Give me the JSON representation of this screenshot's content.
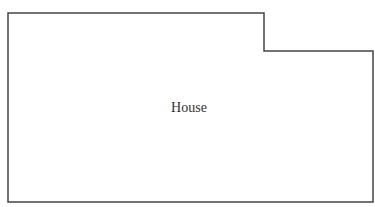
{
  "diagram": {
    "shape": {
      "name": "house-outline",
      "stroke": "#444444",
      "points": "8,13 264,13 264,51 373,51 373,202 8,202"
    },
    "label": {
      "text": "House",
      "x": 189,
      "y": 108
    }
  }
}
